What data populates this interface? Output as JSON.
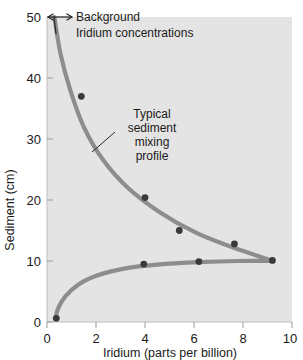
{
  "chart_data": {
    "type": "line",
    "title": "",
    "xlabel": "Iridium (parts per billion)",
    "ylabel": "Sediment (cm)",
    "xlim": [
      0,
      10
    ],
    "ylim": [
      0,
      50
    ],
    "xticks": [
      "0",
      "2",
      "4",
      "6",
      "8",
      "10"
    ],
    "yticks": [
      "0",
      "10",
      "20",
      "30",
      "40",
      "50"
    ],
    "grid": false,
    "legend": "none",
    "series": [
      {
        "name": "Background iridium tail (upper limb)",
        "points": [
          [
            0.3,
            50.0
          ],
          [
            0.55,
            44.0
          ],
          [
            0.95,
            38.0
          ],
          [
            1.5,
            32.0
          ],
          [
            2.3,
            26.5
          ],
          [
            3.3,
            22.0
          ],
          [
            4.6,
            18.0
          ],
          [
            6.1,
            14.6
          ],
          [
            7.6,
            12.2
          ],
          [
            8.7,
            10.7
          ],
          [
            9.2,
            10.0
          ]
        ]
      },
      {
        "name": "Mixing profile (lower limb)",
        "points": [
          [
            0.35,
            0.5
          ],
          [
            0.45,
            2.2
          ],
          [
            0.75,
            4.2
          ],
          [
            1.3,
            6.2
          ],
          [
            2.1,
            7.7
          ],
          [
            3.2,
            8.8
          ],
          [
            4.5,
            9.4
          ],
          [
            6.2,
            9.8
          ],
          [
            7.8,
            10.0
          ],
          [
            9.2,
            10.0
          ]
        ]
      }
    ],
    "datapoints": [
      [
        1.4,
        37.0
      ],
      [
        4.0,
        20.4
      ],
      [
        5.4,
        15.0
      ],
      [
        7.65,
        12.8
      ],
      [
        9.2,
        10.1
      ],
      [
        6.2,
        9.9
      ],
      [
        3.95,
        9.5
      ],
      [
        0.38,
        0.6
      ]
    ],
    "annotations": [
      {
        "id": "background-annotation",
        "lines": [
          "Background",
          "Iridium concentrations"
        ],
        "marker": "double-headed-arrow"
      },
      {
        "id": "mixing-profile-annotation",
        "lines": [
          "Typical",
          "sediment",
          "mixing",
          "profile"
        ],
        "marker": "leader-line"
      }
    ],
    "colors": {
      "plot_background": "#e4e4e4",
      "curve": "#8d8d8d",
      "datapoint": "#3a3a3a",
      "text": "#1a1a1a"
    }
  }
}
